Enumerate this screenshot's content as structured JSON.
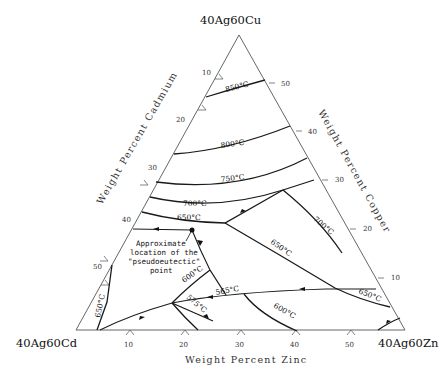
{
  "diagram": {
    "type": "ternary-liquidus-projection",
    "vertices": {
      "top": "40Ag60Cu",
      "bottom_left": "40Ag60Cd",
      "bottom_right": "40Ag60Zn"
    },
    "axes": {
      "left": "Weight Percent Cadmium",
      "right": "Weight Percent Copper",
      "bottom": "Weight Percent Zinc"
    },
    "ticks": {
      "left": [
        "10",
        "20",
        "30",
        "40",
        "50"
      ],
      "right": [
        "50",
        "40",
        "30",
        "20",
        "10"
      ],
      "bottom": [
        "10",
        "20",
        "30",
        "40",
        "50"
      ]
    },
    "isotherms": [
      "850°C",
      "800°C",
      "750°C",
      "700°C",
      "650°C",
      "700°C",
      "650°C",
      "600°C",
      "575°C",
      "565°C",
      "600°C",
      "650°C",
      "650°C"
    ],
    "iso_labels": {
      "t850": "850°C",
      "t800": "800°C",
      "t750": "750°C",
      "t700a": "700°C",
      "t650a": "650°C",
      "t700b": "700°C",
      "t650b": "650°C",
      "t600a": "600°C",
      "t575": "575°C",
      "t565": "565°C",
      "t600b": "600°C",
      "t650c": "650°C",
      "t650d": "650°C"
    },
    "annotation": {
      "line1": "Approximate",
      "line2": "location of the",
      "line3": "\"pseudoeutectic\"",
      "line4": "point"
    }
  }
}
